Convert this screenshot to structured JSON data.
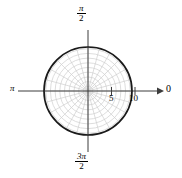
{
  "figure": {
    "background_color": "#ffffff",
    "width": 182,
    "height": 178
  },
  "labels": {
    "angle_top_numerator": "π",
    "angle_top_denominator": "2",
    "angle_bottom_numerator": "3π",
    "angle_bottom_denominator": "2",
    "angle_left": "π",
    "angle_right": "0",
    "tick_5": "5",
    "tick_10": "10"
  },
  "style": {
    "curve_color": "#1a1a1a",
    "axis_color": "#3c3c3c",
    "grid_color": "#cfcfcf",
    "text_color": "#000000"
  },
  "chart_data": {
    "type": "line",
    "coordinate_system": "polar",
    "title": "",
    "xlabel": "",
    "ylabel": "",
    "equation": "r = 9.4",
    "center_px": [
      88,
      91
    ],
    "pixels_per_unit": 4.7,
    "curve": {
      "name": "r = constant",
      "r_value": 9.4,
      "theta_range_rad": [
        0,
        6.283185307179586
      ],
      "closed": true,
      "color": "#1a1a1a",
      "line_width": 1.6
    },
    "radial_axis": {
      "label_right": "0",
      "label_left": "π",
      "ticks": [
        5,
        10
      ],
      "tick_labels": [
        "5",
        "10"
      ],
      "rmax_grid": 9.0,
      "arrow_at_end": true
    },
    "angular_axis": {
      "label_top": "π/2",
      "label_bottom": "3π/2",
      "spokes_deg": [
        0,
        15,
        30,
        45,
        60,
        75,
        90,
        105,
        120,
        135,
        150,
        165,
        180,
        195,
        210,
        225,
        240,
        255,
        270,
        285,
        300,
        315,
        330,
        345
      ]
    },
    "grid": {
      "visible": true,
      "color": "#cfcfcf",
      "ring_radii": [
        1,
        2,
        3,
        4,
        5,
        6,
        7,
        8,
        9
      ],
      "spoke_count": 24
    },
    "legend": {
      "visible": false,
      "position": "none"
    }
  }
}
